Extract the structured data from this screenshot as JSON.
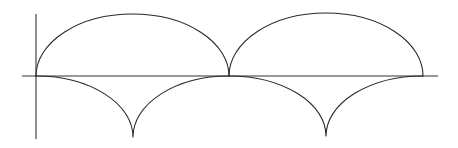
{
  "diagram": {
    "title": "",
    "colors": {
      "background": "#ffffff",
      "stroke": "#2a2a2a",
      "axis": "#333333"
    },
    "axes": {
      "horizontal": {
        "x1": 22,
        "x2": 438,
        "y": 76
      },
      "vertical": {
        "x": 36,
        "y1": 14,
        "y2": 139
      }
    },
    "upper_arches": [
      {
        "x_start": 36,
        "x_end": 229,
        "apex_y": 14,
        "baseline_y": 76
      },
      {
        "x_start": 229,
        "x_end": 423,
        "apex_y": 13,
        "baseline_y": 76
      }
    ],
    "lower_cusps": [
      {
        "x_start": 36,
        "x_end": 229,
        "cusp_x": 133,
        "cusp_y": 137,
        "baseline_y": 76
      },
      {
        "x_start": 229,
        "x_end": 423,
        "cusp_x": 326,
        "cusp_y": 136,
        "baseline_y": 76
      }
    ]
  }
}
